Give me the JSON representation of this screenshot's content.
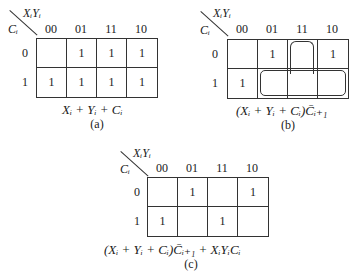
{
  "column_variable": "XᵢYᵢ",
  "row_variable": "Cᵢ",
  "column_headers": [
    "00",
    "01",
    "11",
    "10"
  ],
  "row_headers": [
    "0",
    "1"
  ],
  "maps": [
    {
      "id": "a",
      "caption": "(a)",
      "expression": "Xᵢ + Yᵢ + Cᵢ",
      "cells": [
        [
          "",
          "1",
          "1",
          "1"
        ],
        [
          "1",
          "1",
          "1",
          "1"
        ]
      ]
    },
    {
      "id": "b",
      "caption": "(b)",
      "expression": "(Xᵢ + Yᵢ + Cᵢ)C̄ᵢ₊₁",
      "cells": [
        [
          "",
          "1",
          "",
          "1"
        ],
        [
          "1",
          "",
          "",
          ""
        ]
      ],
      "loops": [
        "row1 cols 01-10 with col 11 row0 (inverted T)"
      ]
    },
    {
      "id": "c",
      "caption": "(c)",
      "expression": "(Xᵢ + Yᵢ + Cᵢ)C̄ᵢ₊₁ + XᵢYᵢCᵢ",
      "cells": [
        [
          "",
          "1",
          "",
          "1"
        ],
        [
          "1",
          "",
          "1",
          ""
        ]
      ]
    }
  ]
}
